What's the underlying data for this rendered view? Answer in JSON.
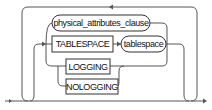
{
  "diagram": {
    "type": "railroad-syntax",
    "nodes": [
      {
        "id": "physical_attributes_clause",
        "label": "physical_attributes_clause",
        "shape": "oval",
        "kind": "nonterminal"
      },
      {
        "id": "TABLESPACE",
        "label": "TABLESPACE",
        "shape": "box",
        "kind": "keyword"
      },
      {
        "id": "tablespace",
        "label": "tablespace",
        "shape": "oval",
        "kind": "nonterminal"
      },
      {
        "id": "LOGGING",
        "label": "LOGGING",
        "shape": "box",
        "kind": "keyword"
      },
      {
        "id": "NOLOGGING",
        "label": "NOLOGGING",
        "shape": "box",
        "kind": "keyword"
      }
    ],
    "edges": [
      {
        "from": "start",
        "to": "choice"
      },
      {
        "from": "TABLESPACE",
        "to": "tablespace"
      },
      {
        "from": "choice",
        "to": "end"
      },
      {
        "from": "end",
        "to": "start",
        "type": "repeat-loop"
      }
    ],
    "choices": [
      [
        "physical_attributes_clause"
      ],
      [
        "TABLESPACE",
        "tablespace"
      ],
      [
        [
          "LOGGING",
          "NOLOGGING"
        ]
      ]
    ],
    "colors": {
      "line": "#555555",
      "node_border": "#333333",
      "text": "#111111",
      "background": "#ffffff"
    }
  }
}
